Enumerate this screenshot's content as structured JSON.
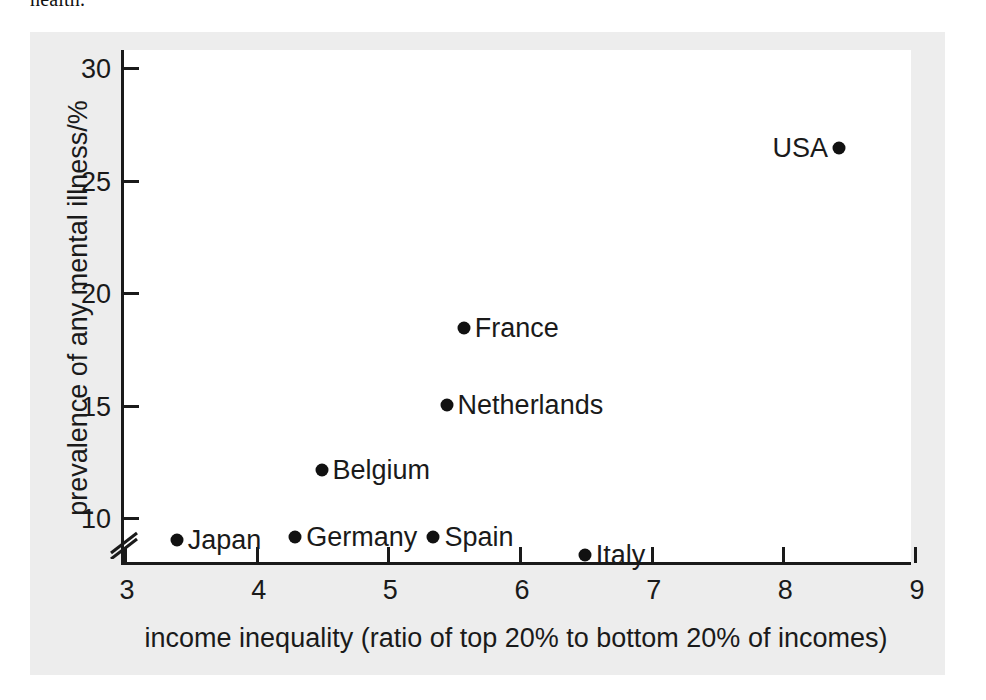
{
  "caption_tail": "health.",
  "chart_data": {
    "type": "scatter",
    "title": "",
    "xlabel": "income inequality (ratio of top 20% to bottom 20% of incomes)",
    "ylabel": "prevalence of any mental illness/%",
    "xlim": [
      3,
      9
    ],
    "ylim": [
      8,
      30
    ],
    "y_axis_break": true,
    "grid": false,
    "legend": "none",
    "xticks": [
      "3",
      "4",
      "5",
      "6",
      "7",
      "8",
      "9"
    ],
    "xtick_values": [
      3,
      4,
      5,
      6,
      7,
      8,
      9
    ],
    "yticks": [
      "10",
      "15",
      "20",
      "25",
      "30"
    ],
    "ytick_values": [
      10,
      15,
      20,
      25,
      30
    ],
    "marker_color": "#111111",
    "points": [
      {
        "label": "Japan",
        "x": 3.4,
        "y": 9.0,
        "label_side": "right"
      },
      {
        "label": "Germany",
        "x": 4.3,
        "y": 9.1,
        "label_side": "right"
      },
      {
        "label": "Belgium",
        "x": 4.5,
        "y": 12.1,
        "label_side": "right"
      },
      {
        "label": "Spain",
        "x": 5.35,
        "y": 9.1,
        "label_side": "right"
      },
      {
        "label": "Netherlands",
        "x": 5.45,
        "y": 15.0,
        "label_side": "right"
      },
      {
        "label": "France",
        "x": 5.58,
        "y": 18.4,
        "label_side": "right"
      },
      {
        "label": "Italy",
        "x": 6.5,
        "y": 8.3,
        "label_side": "right"
      },
      {
        "label": "USA",
        "x": 8.43,
        "y": 26.4,
        "label_side": "left"
      }
    ]
  }
}
